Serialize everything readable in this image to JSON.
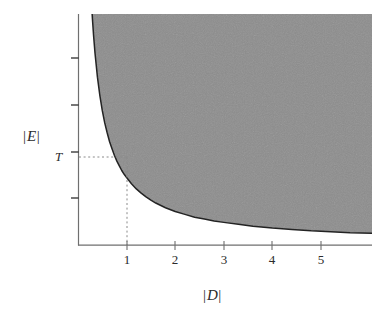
{
  "figure": {
    "background_color": "#ffffff",
    "ink_color": "#2b2b2b",
    "shade_color": "#8d8d8d",
    "curve_color": "#232323",
    "guide_color": "#8a8a8a"
  },
  "axes": {
    "x": {
      "label_bar_left": "|",
      "label_var": "D",
      "label_bar_right": "|",
      "label_text": "|D|",
      "ticks": [
        {
          "value": 1,
          "label": "1",
          "px": 127
        },
        {
          "value": 2,
          "label": "2",
          "px": 175
        },
        {
          "value": 3,
          "label": "3",
          "px": 224
        },
        {
          "value": 4,
          "label": "4",
          "px": 272
        },
        {
          "value": 5,
          "label": "5",
          "px": 321
        }
      ],
      "range_px": [
        78,
        372
      ],
      "origin_px": 78.5,
      "px_per_unit": 48.5
    },
    "y": {
      "label_bar_left": "|",
      "label_var": "E",
      "label_bar_right": "|",
      "label_text": "|E|",
      "ticks": [
        {
          "label": "",
          "px": 58
        },
        {
          "label": "",
          "px": 105
        },
        {
          "label": "T",
          "px": 152
        },
        {
          "label": "",
          "px": 198
        }
      ],
      "threshold_label": "T",
      "range_px": [
        14,
        245
      ]
    }
  },
  "chart_data": {
    "type": "area",
    "title": "",
    "subtitle": "",
    "xlabel": "|D|",
    "ylabel": "|E|",
    "xlim": [
      0,
      6.05
    ],
    "ylim": [
      0,
      4.9
    ],
    "grid": false,
    "legend": null,
    "series": [
      {
        "name": "boundary",
        "kind": "curve",
        "equation": "|E| = T / |D|",
        "x": [
          0.285,
          0.3,
          0.32,
          0.35,
          0.4,
          0.45,
          0.5,
          0.55,
          0.6,
          0.65,
          0.7,
          0.75,
          0.8,
          0.85,
          0.9,
          0.95,
          1.0,
          1.1,
          1.2,
          1.3,
          1.4,
          1.5,
          1.6,
          1.8,
          2.0,
          2.2,
          2.4,
          2.6,
          2.8,
          3.0,
          3.3,
          3.6,
          4.0,
          4.4,
          4.8,
          5.2,
          5.6,
          6.05
        ],
        "y": [
          5.0,
          4.75,
          4.45,
          4.07,
          3.56,
          3.17,
          2.85,
          2.59,
          2.38,
          2.19,
          2.04,
          1.9,
          1.78,
          1.68,
          1.58,
          1.5,
          1.43,
          1.3,
          1.19,
          1.1,
          1.02,
          0.95,
          0.89,
          0.79,
          0.71,
          0.65,
          0.59,
          0.55,
          0.51,
          0.48,
          0.44,
          0.4,
          0.36,
          0.33,
          0.3,
          0.28,
          0.26,
          0.25
        ]
      },
      {
        "name": "shaded-region",
        "kind": "fill-above-curve",
        "color": "#8d8d8d",
        "label": ""
      }
    ],
    "annotations": [
      {
        "name": "threshold-guides",
        "type": "dotted-lines",
        "point": {
          "x": 1,
          "y": "T"
        },
        "x_label": "1",
        "y_label": "T"
      }
    ]
  }
}
